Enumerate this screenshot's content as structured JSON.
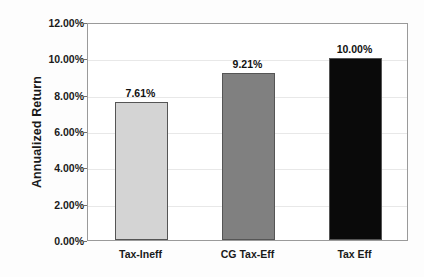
{
  "chart_data": {
    "type": "bar",
    "title": "",
    "subtitle": "",
    "xlabel": "",
    "ylabel": "Annualized Return",
    "categories": [
      "Tax-Ineff",
      "CG Tax-Eff",
      "Tax Eff"
    ],
    "values": [
      7.61,
      9.21,
      10.0
    ],
    "data_labels": [
      "7.61%",
      "9.21%",
      "10.00%"
    ],
    "bar_colors": [
      "#d4d4d4",
      "#808080",
      "#0a0a0a"
    ],
    "bar_border_color": "#555555",
    "ylim": [
      0,
      12
    ],
    "ytick_values": [
      0,
      2,
      4,
      6,
      8,
      10,
      12
    ],
    "ytick_labels": [
      "0.00%",
      "2.00%",
      "4.00%",
      "6.00%",
      "8.00%",
      "10.00%",
      "12.00%"
    ],
    "grid": true,
    "grid_axis": "y",
    "grid_color": "#e8e8e8",
    "legend": false,
    "legend_position": "none",
    "plot_background": "#ffffff",
    "figure_background": "#fdfdfd",
    "axis_color": "#9a9a9a"
  }
}
